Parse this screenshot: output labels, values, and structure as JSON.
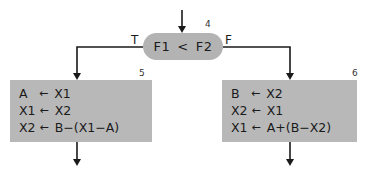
{
  "diagram": {
    "type": "flowchart",
    "decision": {
      "id": "4",
      "left_operand": "F1",
      "operator": "<",
      "right_operand": "F2",
      "true_label": "T",
      "false_label": "F"
    },
    "true_block": {
      "id": "5",
      "statements": [
        {
          "lhs": "A",
          "arrow": "←",
          "rhs": "X1"
        },
        {
          "lhs": "X1",
          "arrow": "←",
          "rhs": "X2"
        },
        {
          "lhs": "X2",
          "arrow": "←",
          "rhs": "B−(X1−A)"
        }
      ]
    },
    "false_block": {
      "id": "6",
      "statements": [
        {
          "lhs": "B",
          "arrow": "←",
          "rhs": "X2"
        },
        {
          "lhs": "X2",
          "arrow": "←",
          "rhs": "X1"
        },
        {
          "lhs": "X1",
          "arrow": "←",
          "rhs": "A+(B−X2)"
        }
      ]
    },
    "colors": {
      "decision_fill": "#b3b3b3",
      "block_fill": "#b8b8b8",
      "line": "#1a1a1a"
    }
  }
}
